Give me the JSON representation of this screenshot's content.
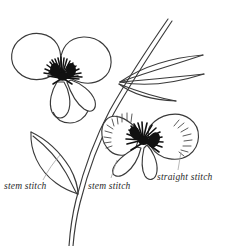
{
  "illustration": {
    "title": "Pansy embroidery stitch diagram",
    "background_color": "#ffffff",
    "ink_color": "#2a2a2a",
    "fill_color": "#111111",
    "subject": "two pansy flowers with stem and leaves"
  },
  "labels": {
    "stem_stitch_left": "stem stitch",
    "stem_stitch_middle": "stem stitch",
    "straight_stitch": "straight stitch"
  },
  "parts": {
    "upper_flower": "upper pansy flower",
    "lower_flower": "lower pansy flower",
    "upper_flower_center": "dark radiating flower center",
    "lower_flower_center": "dark radiating flower center",
    "left_leaf": "pointed leaf lower left",
    "upper_leaves": "two narrow leaves upper right",
    "main_stem": "main stem",
    "straight_stitch_marks": "short radiating straight stitches on petals",
    "leader_line_left": "leader line to left stem",
    "leader_line_middle": "leader line to lower flower stem",
    "leader_line_right": "leader line to stitched petal"
  }
}
